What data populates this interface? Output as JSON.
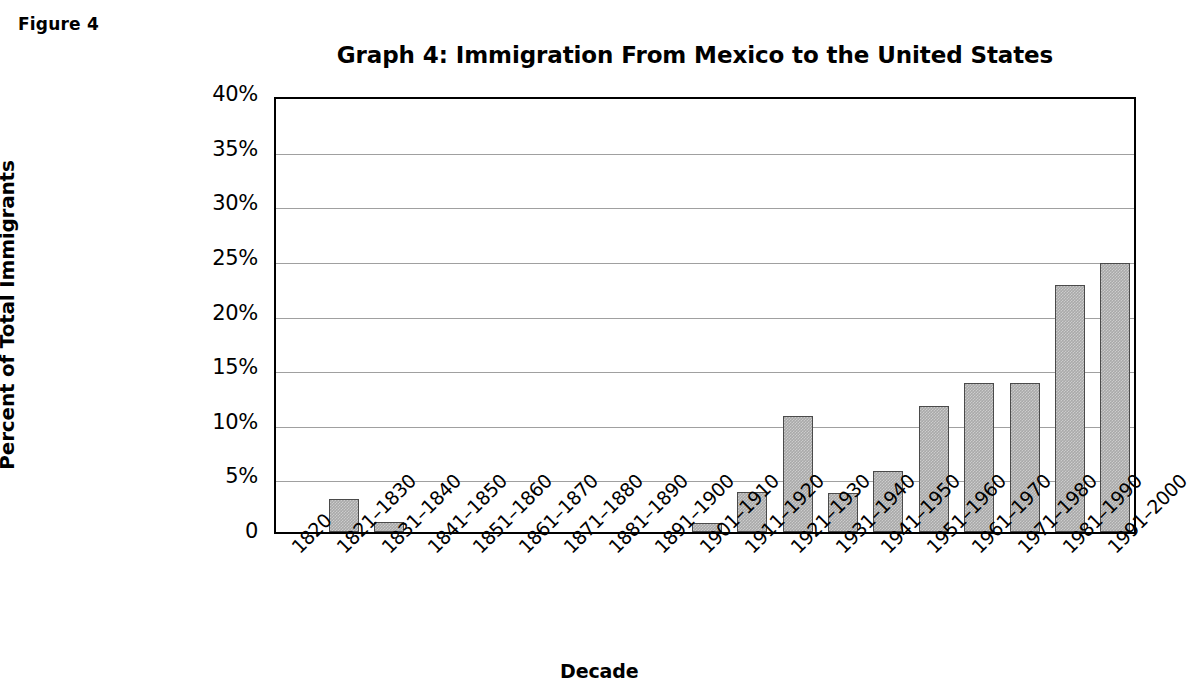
{
  "figure": {
    "label": "Figure 4"
  },
  "chart_data": {
    "type": "bar",
    "title": "Graph 4: Immigration From Mexico to the United States",
    "xlabel": "Decade",
    "ylabel": "Percent of Total Immigrants",
    "ylim": [
      0,
      40
    ],
    "ytick_labels": [
      "40%",
      "35%",
      "30%",
      "25%",
      "20%",
      "15%",
      "10%",
      "5%",
      "0"
    ],
    "ytick_values": [
      40,
      35,
      30,
      25,
      20,
      15,
      10,
      5,
      0
    ],
    "grid": true,
    "legend": "none",
    "bar_color": "#a9a9a9",
    "bar_edge_color": "#4a4a4a",
    "categories": [
      "1820",
      "1821–1830",
      "1831–1840",
      "1841–1850",
      "1851–1860",
      "1861–1870",
      "1871–1880",
      "1881–1890",
      "1891–1900",
      "1901–1910",
      "1911–1920",
      "1921–1930",
      "1931–1940",
      "1941–1950",
      "1951–1960",
      "1961–1970",
      "1971–1980",
      "1981–1990",
      "1991–2000"
    ],
    "values": [
      0,
      3.0,
      0.9,
      0,
      0,
      0,
      0,
      0,
      0,
      0.8,
      3.7,
      10.6,
      3.6,
      5.6,
      11.5,
      13.6,
      13.6,
      22.6,
      24.6
    ]
  }
}
